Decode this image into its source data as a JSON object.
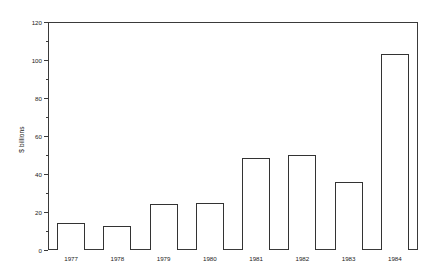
{
  "chart_data": {
    "type": "bar",
    "title": "",
    "xlabel": "",
    "ylabel": "$ billions",
    "categories": [
      "1977",
      "1978",
      "1979",
      "1980",
      "1981",
      "1982",
      "1983",
      "1984"
    ],
    "values": [
      14,
      12.5,
      24,
      25,
      48.5,
      50,
      36,
      103
    ],
    "ylim": [
      0,
      120
    ],
    "yticks": [
      0,
      20,
      40,
      60,
      80,
      100,
      120
    ],
    "ytick_labels": [
      "0",
      "20",
      "40",
      "60",
      "80",
      "100",
      "120"
    ],
    "yminor_ticks": [
      10,
      30,
      50,
      70,
      90,
      110
    ],
    "grid": false,
    "legend": null,
    "bar_fill": "#ffffff",
    "bar_edge": "#333333",
    "axis_color": "#3a3a3a",
    "background": "#ffffff"
  }
}
